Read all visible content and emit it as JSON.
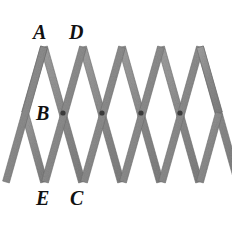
{
  "figure": {
    "background_color": "#ffffff",
    "strip_color": "#8f8f8f",
    "strip_edge_color": "#6e6e6e",
    "pivot_color": "#3a3a3a",
    "label_color": "#111111"
  },
  "labels": [
    {
      "id": "A",
      "text": "A",
      "x": 33,
      "y": 22,
      "role": "top-left-apex-label"
    },
    {
      "id": "D",
      "text": "D",
      "x": 69,
      "y": 22,
      "role": "top-second-apex-label"
    },
    {
      "id": "B",
      "text": "B",
      "x": 36,
      "y": 103,
      "role": "left-middle-vertex-label"
    },
    {
      "id": "E",
      "text": "E",
      "x": 36,
      "y": 188,
      "role": "bottom-left-apex-label"
    },
    {
      "id": "C",
      "text": "C",
      "x": 70,
      "y": 188,
      "role": "bottom-second-apex-label"
    }
  ],
  "geometry": {
    "left_vertex_x": 25,
    "right_vertex_x": 219,
    "top_y": 47,
    "middle_y": 113,
    "bottom_y": 182,
    "cell_half_width": 19,
    "top_apex_count": 5,
    "bottom_apex_count": 5,
    "pivot_count": 4,
    "strip_width": 7,
    "top_apexes_x": [
      44,
      83,
      122,
      161,
      200
    ],
    "bottom_apexes_x": [
      44,
      83,
      122,
      161,
      200
    ],
    "pivots_x": [
      63,
      102,
      141,
      180
    ],
    "pivot_y": 113,
    "pivot_radius": 2.6
  },
  "strips": {
    "down_right_count": 5,
    "down_left_count": 5,
    "description": "Two families of parallel zigzag strips crossing at pivot points forming rhombus cells"
  }
}
